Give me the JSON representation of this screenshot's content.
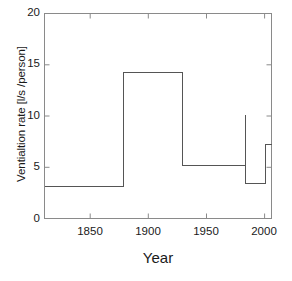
{
  "chart_data": {
    "type": "line",
    "subtype": "step-post",
    "title": "",
    "xlabel": "Year",
    "ylabel": "Ventialtion rate [l/s /person]",
    "xlim": [
      1836,
      2000
    ],
    "ylim": [
      0,
      20
    ],
    "xticks": [
      1850,
      1900,
      1950,
      2000
    ],
    "yticks": [
      0,
      5,
      10,
      15,
      20
    ],
    "xtick_labels": [
      "1850",
      "1900",
      "1950",
      "2000"
    ],
    "ytick_labels": [
      "0",
      "5",
      "10",
      "15",
      "20"
    ],
    "grid": false,
    "legend": null,
    "line_color": "#555555",
    "background_color": "#ffffff",
    "steps": [
      {
        "x_start": 1836,
        "x_end": 1893,
        "value": 3.1
      },
      {
        "x_start": 1893,
        "x_end": 1936,
        "value": 14.2
      },
      {
        "x_start": 1936,
        "x_end": 1981,
        "value": 5.2
      },
      {
        "x_start": 1981,
        "x_end": 1981,
        "value": 10.1
      },
      {
        "x_start": 1981,
        "x_end": 1996,
        "value": 3.4
      },
      {
        "x_start": 1996,
        "x_end": 2000,
        "value": 7.2
      }
    ],
    "x": [
      1836,
      1893,
      1893,
      1936,
      1936,
      1981,
      1981,
      1981,
      1981,
      1996,
      1996,
      2000
    ],
    "y": [
      3.1,
      3.1,
      14.2,
      14.2,
      5.2,
      5.2,
      10.1,
      5.2,
      3.4,
      3.4,
      7.2,
      7.2
    ],
    "annotations": []
  },
  "axes": {
    "frame_color": "#888888",
    "tick_color": "#888888"
  }
}
